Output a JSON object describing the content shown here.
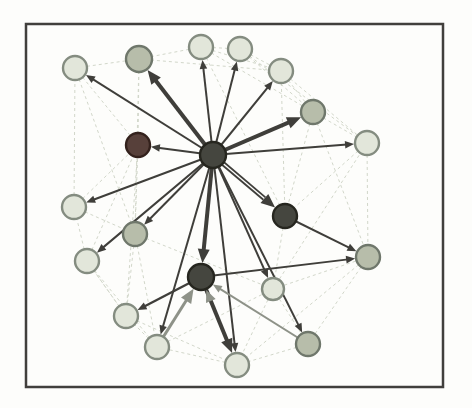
{
  "figure": {
    "width": 472,
    "height": 408,
    "background_color": "#fdfdfb",
    "border": {
      "x": 26,
      "y": 24,
      "w": 417,
      "h": 363,
      "color": "#413f3c",
      "stroke_width": 2.5
    }
  },
  "graph": {
    "colors": {
      "solid_edge": "#3f3e3a",
      "gray_edge": "#8e9288",
      "dashed_edge": "#d2d7ca"
    },
    "node_styles": {
      "light": {
        "fill": "#e2e6da",
        "stroke": "#848c80"
      },
      "medium": {
        "fill": "#b7bdaa",
        "stroke": "#6f776b"
      },
      "dark": {
        "fill": "#45463f",
        "stroke": "#26261f"
      },
      "darkred": {
        "fill": "#57403a",
        "stroke": "#33211c"
      }
    },
    "nodes": [
      {
        "id": "a",
        "x": 75,
        "y": 68,
        "r": 12,
        "style": "light"
      },
      {
        "id": "b",
        "x": 139,
        "y": 59,
        "r": 13,
        "style": "medium"
      },
      {
        "id": "c",
        "x": 201,
        "y": 47,
        "r": 12,
        "style": "light"
      },
      {
        "id": "d",
        "x": 240,
        "y": 49,
        "r": 12,
        "style": "light"
      },
      {
        "id": "e",
        "x": 281,
        "y": 71,
        "r": 12,
        "style": "light"
      },
      {
        "id": "f",
        "x": 313,
        "y": 112,
        "r": 12,
        "style": "medium"
      },
      {
        "id": "g",
        "x": 367,
        "y": 143,
        "r": 12,
        "style": "light"
      },
      {
        "id": "h",
        "x": 368,
        "y": 257,
        "r": 12,
        "style": "medium"
      },
      {
        "id": "i",
        "x": 74,
        "y": 207,
        "r": 12,
        "style": "light"
      },
      {
        "id": "j",
        "x": 135,
        "y": 234,
        "r": 12,
        "style": "medium"
      },
      {
        "id": "k",
        "x": 87,
        "y": 261,
        "r": 12,
        "style": "light"
      },
      {
        "id": "l",
        "x": 126,
        "y": 316,
        "r": 12,
        "style": "light"
      },
      {
        "id": "m",
        "x": 157,
        "y": 347,
        "r": 12,
        "style": "light"
      },
      {
        "id": "n",
        "x": 237,
        "y": 365,
        "r": 12,
        "style": "light"
      },
      {
        "id": "o",
        "x": 273,
        "y": 289,
        "r": 11,
        "style": "light"
      },
      {
        "id": "p",
        "x": 308,
        "y": 344,
        "r": 12,
        "style": "medium"
      },
      {
        "id": "r",
        "x": 138,
        "y": 145,
        "r": 12,
        "style": "darkred"
      },
      {
        "id": "q",
        "x": 285,
        "y": 216,
        "r": 12,
        "style": "dark"
      },
      {
        "id": "hub1",
        "x": 213,
        "y": 155,
        "r": 13,
        "style": "dark"
      },
      {
        "id": "hub2",
        "x": 201,
        "y": 277,
        "r": 13,
        "style": "dark"
      }
    ],
    "solid_edges": [
      {
        "from": "hub1",
        "to": "a",
        "w": 2
      },
      {
        "from": "hub1",
        "to": "b",
        "w": 4
      },
      {
        "from": "hub1",
        "to": "c",
        "w": 2
      },
      {
        "from": "hub1",
        "to": "d",
        "w": 2
      },
      {
        "from": "hub1",
        "to": "e",
        "w": 2
      },
      {
        "from": "hub1",
        "to": "r",
        "w": 2
      },
      {
        "from": "hub1",
        "to": "f",
        "w": 4
      },
      {
        "from": "hub1",
        "to": "g",
        "w": 2
      },
      {
        "from": "hub1",
        "to": "i",
        "w": 2
      },
      {
        "from": "hub1",
        "to": "j",
        "w": 2
      },
      {
        "from": "hub1",
        "to": "k",
        "w": 2
      },
      {
        "from": "hub1",
        "to": "m",
        "w": 2
      },
      {
        "from": "hub1",
        "to": "n",
        "w": 2
      },
      {
        "from": "hub1",
        "to": "o",
        "w": 2
      },
      {
        "from": "hub1",
        "to": "p",
        "w": 2
      },
      {
        "from": "hub1",
        "to": "hub2",
        "w": 4
      },
      {
        "from": "hub1",
        "to": "q",
        "w": 3.2,
        "double": true
      },
      {
        "from": "hub2",
        "to": "n",
        "w": 4,
        "back_arrow": true
      },
      {
        "from": "hub2",
        "to": "h",
        "w": 2
      },
      {
        "from": "hub2",
        "to": "l",
        "w": 2.4
      },
      {
        "from": "q",
        "to": "h",
        "w": 2
      },
      {
        "from": "m",
        "to": "hub2",
        "w": 3,
        "gray": true
      },
      {
        "from": "p",
        "to": "hub2",
        "w": 2,
        "gray": true
      }
    ],
    "dashed_edges": [
      [
        "a",
        "b"
      ],
      [
        "b",
        "c"
      ],
      [
        "c",
        "d"
      ],
      [
        "d",
        "e"
      ],
      [
        "e",
        "f"
      ],
      [
        "f",
        "g"
      ],
      [
        "g",
        "h"
      ],
      [
        "h",
        "p"
      ],
      [
        "p",
        "n"
      ],
      [
        "n",
        "m"
      ],
      [
        "m",
        "l"
      ],
      [
        "l",
        "k"
      ],
      [
        "k",
        "i"
      ],
      [
        "i",
        "a"
      ],
      [
        "a",
        "r"
      ],
      [
        "b",
        "r"
      ],
      [
        "i",
        "r"
      ],
      [
        "j",
        "r"
      ],
      [
        "k",
        "r"
      ],
      [
        "l",
        "r"
      ],
      [
        "a",
        "j"
      ],
      [
        "b",
        "j"
      ],
      [
        "i",
        "j"
      ],
      [
        "j",
        "l"
      ],
      [
        "j",
        "o"
      ],
      [
        "k",
        "m"
      ],
      [
        "l",
        "n"
      ],
      [
        "c",
        "e"
      ],
      [
        "c",
        "f"
      ],
      [
        "d",
        "f"
      ],
      [
        "d",
        "g"
      ],
      [
        "e",
        "g"
      ],
      [
        "e",
        "q"
      ],
      [
        "f",
        "q"
      ],
      [
        "g",
        "q"
      ],
      [
        "f",
        "h"
      ],
      [
        "o",
        "h"
      ],
      [
        "o",
        "p"
      ],
      [
        "o",
        "n"
      ],
      [
        "o",
        "g"
      ],
      [
        "m",
        "o"
      ],
      [
        "q",
        "o"
      ],
      [
        "c",
        "q"
      ],
      [
        "b",
        "e"
      ],
      [
        "j",
        "m"
      ],
      [
        "h",
        "n"
      ],
      [
        "k",
        "l"
      ]
    ]
  }
}
